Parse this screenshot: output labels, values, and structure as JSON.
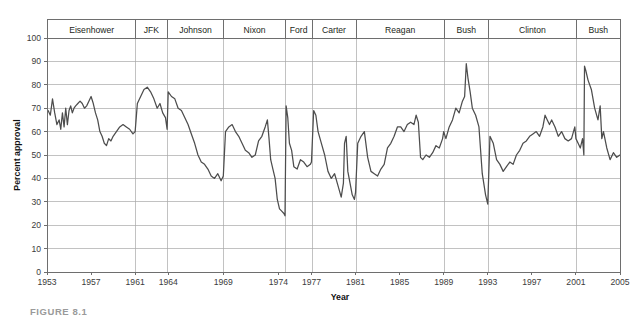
{
  "figure": {
    "caption": "FIGURE 8.1"
  },
  "chart_data": {
    "type": "line",
    "title": "",
    "xlabel": "Year",
    "ylabel": "Percent approval",
    "xlim": [
      1953,
      2005
    ],
    "ylim": [
      0,
      100
    ],
    "grid": true,
    "legend": "none",
    "yticks": [
      0,
      10,
      20,
      30,
      40,
      50,
      60,
      70,
      80,
      90,
      100
    ],
    "ytick_labels": [
      "0",
      "10",
      "20",
      "30",
      "40",
      "50",
      "60",
      "70",
      "80",
      "90",
      "100"
    ],
    "xticks": [
      1953,
      1957,
      1961,
      1964,
      1969,
      1974,
      1977,
      1981,
      1985,
      1989,
      1993,
      1997,
      2001,
      2005
    ],
    "xtick_labels": [
      "1953",
      "1957",
      "1961",
      "1964",
      "1969",
      "1974",
      "1977",
      "1981",
      "1985",
      "1989",
      "1993",
      "1997",
      "2001",
      "2005"
    ],
    "series_name": "Presidential approval",
    "line_color": "#4d4d4d",
    "bands": [
      {
        "label": "Eisenhower",
        "start": 1953.05,
        "end": 1961.05
      },
      {
        "label": "JFK",
        "start": 1961.05,
        "end": 1963.9
      },
      {
        "label": "Johnson",
        "start": 1963.9,
        "end": 1969.05
      },
      {
        "label": "Nixon",
        "start": 1969.05,
        "end": 1974.62
      },
      {
        "label": "Ford",
        "start": 1974.62,
        "end": 1977.05
      },
      {
        "label": "Carter",
        "start": 1977.05,
        "end": 1981.05
      },
      {
        "label": "Reagan",
        "start": 1981.05,
        "end": 1989.05
      },
      {
        "label": "Bush",
        "start": 1989.05,
        "end": 1993.05
      },
      {
        "label": "Clinton",
        "start": 1993.05,
        "end": 2001.05
      },
      {
        "label": "Bush",
        "start": 2001.05,
        "end": 2005.0
      }
    ],
    "x": [
      1953.1,
      1953.3,
      1953.5,
      1953.7,
      1953.9,
      1954.1,
      1954.25,
      1954.4,
      1954.55,
      1954.7,
      1954.85,
      1955.0,
      1955.15,
      1955.3,
      1955.45,
      1955.6,
      1955.8,
      1956.0,
      1956.2,
      1956.4,
      1956.6,
      1956.8,
      1957.0,
      1957.2,
      1957.4,
      1957.6,
      1957.8,
      1958.0,
      1958.2,
      1958.4,
      1958.6,
      1958.8,
      1959.0,
      1959.3,
      1959.6,
      1959.9,
      1960.2,
      1960.5,
      1960.8,
      1961.0,
      1961.2,
      1961.5,
      1961.8,
      1962.1,
      1962.4,
      1962.7,
      1963.0,
      1963.25,
      1963.5,
      1963.75,
      1963.9,
      1964.0,
      1964.3,
      1964.6,
      1964.9,
      1965.2,
      1965.5,
      1965.8,
      1966.1,
      1966.4,
      1966.7,
      1967.0,
      1967.3,
      1967.6,
      1967.9,
      1968.2,
      1968.5,
      1968.8,
      1969.0,
      1969.2,
      1969.5,
      1969.8,
      1970.1,
      1970.4,
      1970.7,
      1971.0,
      1971.3,
      1971.6,
      1971.9,
      1972.2,
      1972.5,
      1972.8,
      1973.0,
      1973.15,
      1973.3,
      1973.5,
      1973.7,
      1973.9,
      1974.1,
      1974.3,
      1974.5,
      1974.6,
      1974.7,
      1974.85,
      1975.0,
      1975.2,
      1975.4,
      1975.7,
      1976.0,
      1976.3,
      1976.6,
      1976.9,
      1977.0,
      1977.2,
      1977.4,
      1977.6,
      1977.9,
      1978.2,
      1978.5,
      1978.8,
      1979.1,
      1979.4,
      1979.7,
      1979.9,
      1980.0,
      1980.15,
      1980.3,
      1980.5,
      1980.7,
      1980.9,
      1981.0,
      1981.2,
      1981.5,
      1981.8,
      1982.1,
      1982.4,
      1982.7,
      1983.0,
      1983.3,
      1983.6,
      1983.9,
      1984.2,
      1984.5,
      1984.8,
      1985.1,
      1985.4,
      1985.7,
      1986.0,
      1986.3,
      1986.5,
      1986.7,
      1986.9,
      1987.1,
      1987.4,
      1987.7,
      1988.0,
      1988.3,
      1988.6,
      1988.9,
      1989.0,
      1989.2,
      1989.5,
      1989.8,
      1990.1,
      1990.4,
      1990.7,
      1990.9,
      1991.05,
      1991.2,
      1991.4,
      1991.6,
      1991.9,
      1992.2,
      1992.5,
      1992.8,
      1993.0,
      1993.2,
      1993.5,
      1993.8,
      1994.1,
      1994.4,
      1994.7,
      1995.0,
      1995.3,
      1995.6,
      1995.9,
      1996.2,
      1996.5,
      1996.8,
      1997.1,
      1997.4,
      1997.7,
      1998.0,
      1998.2,
      1998.4,
      1998.6,
      1998.8,
      1999.1,
      1999.4,
      1999.7,
      2000.0,
      2000.3,
      2000.6,
      2000.9,
      2001.0,
      2001.2,
      2001.4,
      2001.6,
      2001.72,
      2001.78,
      2001.9,
      2002.1,
      2002.4,
      2002.7,
      2003.0,
      2003.2,
      2003.35,
      2003.5,
      2003.8,
      2004.1,
      2004.4,
      2004.7,
      2005.0
    ],
    "y": [
      69,
      67,
      74,
      68,
      63,
      65,
      61,
      68,
      62,
      70,
      63,
      69,
      71,
      68,
      70,
      71,
      72,
      73,
      72,
      70,
      71,
      73,
      75,
      72,
      68,
      65,
      60,
      58,
      55,
      54,
      57,
      56,
      58,
      60,
      62,
      63,
      62,
      61,
      59,
      60,
      72,
      75,
      78,
      79,
      77,
      74,
      70,
      72,
      68,
      66,
      61,
      77,
      75,
      74,
      70,
      69,
      66,
      63,
      59,
      55,
      50,
      47,
      46,
      44,
      41,
      40,
      42,
      39,
      41,
      60,
      62,
      63,
      60,
      58,
      55,
      52,
      51,
      49,
      50,
      56,
      58,
      62,
      65,
      57,
      48,
      44,
      40,
      31,
      27,
      26,
      25,
      24,
      71,
      66,
      55,
      52,
      45,
      44,
      48,
      47,
      45,
      46,
      47,
      69,
      67,
      60,
      55,
      50,
      43,
      40,
      42,
      37,
      32,
      38,
      55,
      58,
      43,
      38,
      33,
      31,
      34,
      55,
      58,
      60,
      49,
      43,
      42,
      41,
      44,
      46,
      53,
      55,
      58,
      62,
      62,
      60,
      63,
      64,
      63,
      67,
      64,
      49,
      48,
      50,
      49,
      51,
      54,
      53,
      57,
      60,
      57,
      62,
      65,
      70,
      68,
      73,
      75,
      89,
      83,
      77,
      70,
      67,
      62,
      42,
      33,
      29,
      58,
      55,
      48,
      46,
      43,
      45,
      47,
      46,
      50,
      52,
      55,
      56,
      58,
      59,
      60,
      58,
      62,
      67,
      65,
      63,
      65,
      62,
      58,
      60,
      57,
      56,
      57,
      62,
      57,
      55,
      53,
      57,
      50,
      88,
      86,
      82,
      78,
      70,
      65,
      71,
      57,
      60,
      53,
      48,
      51,
      49,
      50
    ]
  }
}
